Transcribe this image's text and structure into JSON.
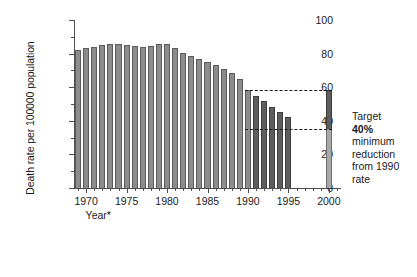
{
  "chart_data": {
    "type": "bar",
    "title": "",
    "xlabel": "Year*",
    "ylabel": "Death rate per 100000 population",
    "ylim": [
      0,
      100
    ],
    "xlim": [
      1968.5,
      2001.5
    ],
    "grid": false,
    "legend": null,
    "y_ticks_major": [
      0,
      20,
      40,
      60,
      80,
      100
    ],
    "y_ticks_minor": [
      10,
      30,
      50,
      70,
      90
    ],
    "x_ticks_major": [
      1970,
      1975,
      1980,
      1985,
      1990,
      1995,
      2000
    ],
    "series": [
      {
        "name": "Observed death rate",
        "color": "#8c8c8c",
        "x": [
          1969,
          1970,
          1971,
          1972,
          1973,
          1974,
          1975,
          1976,
          1977,
          1978,
          1979,
          1980,
          1981,
          1982,
          1983,
          1984,
          1985,
          1986,
          1987,
          1988,
          1989,
          1990
        ],
        "values": [
          82,
          83.5,
          84,
          85,
          86,
          85.5,
          85,
          84.5,
          84,
          84.5,
          85.5,
          85.5,
          83.5,
          80.5,
          78.5,
          76.5,
          75,
          73,
          71,
          68.5,
          65,
          58.5
        ]
      },
      {
        "name": "Recent death rate",
        "color": "#5e5e5e",
        "x": [
          1991,
          1992,
          1993,
          1994,
          1995
        ],
        "values": [
          55,
          52,
          48.5,
          45.5,
          42.5
        ]
      },
      {
        "name": "Target 2000",
        "color": "#5e5e5e",
        "x": [
          2000
        ],
        "values": [
          58.5
        ],
        "target_value": 35,
        "target_color": "#a8a8a8"
      }
    ],
    "reference_lines": [
      {
        "name": "1990 baseline rate",
        "y": 58.5,
        "x_from": 1990,
        "x_to": 2000,
        "style": "dashed"
      },
      {
        "name": "40% reduction target",
        "y": 35,
        "x_from": 1990,
        "x_to": 2000,
        "style": "dashed"
      }
    ],
    "annotation": {
      "line1": "Target",
      "line2": "40%",
      "line3": "minimum",
      "line4": "reduction",
      "line5": "from 1990",
      "line6": "rate"
    }
  }
}
